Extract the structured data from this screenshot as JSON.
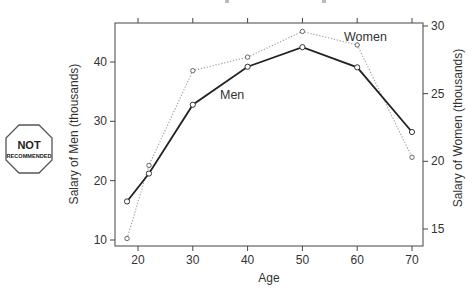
{
  "badge": {
    "line1": "NOT",
    "line2": "RECOMMENDED"
  },
  "chart_data": {
    "type": "line",
    "title": "",
    "xlabel": "Age",
    "ylabel": "Salary of Men (thousands)",
    "y2label": "Salary of Women (thousands)",
    "x": [
      18,
      22,
      30,
      40,
      50,
      60,
      70
    ],
    "x_ticks": [
      "20",
      "30",
      "40",
      "50",
      "60",
      "70"
    ],
    "x_tick_values": [
      20,
      30,
      40,
      50,
      60,
      70
    ],
    "y_ticks": [
      "10",
      "20",
      "30",
      "40"
    ],
    "y_tick_values": [
      10,
      20,
      30,
      40
    ],
    "y2_ticks": [
      "15",
      "20",
      "25",
      "30"
    ],
    "y2_tick_values": [
      15,
      20,
      25,
      30
    ],
    "xlim": [
      16,
      72
    ],
    "ylim": [
      8.9,
      46.5
    ],
    "y2lim": [
      14.2,
      30.3
    ],
    "grid": false,
    "legend": "none (direct line labels)",
    "series": [
      {
        "name": "Men",
        "axis": "left",
        "style": "solid",
        "color": "#222222",
        "values": [
          16.5,
          21.2,
          32.8,
          39.2,
          42.5,
          39.1,
          28.2
        ]
      },
      {
        "name": "Women",
        "axis": "right",
        "style": "dotted",
        "color": "#999999",
        "values": [
          14.3,
          19.7,
          26.7,
          27.7,
          29.6,
          28.6,
          20.3
        ]
      }
    ],
    "annotations": [
      {
        "text": "Men",
        "near_age": 37
      },
      {
        "text": "Women",
        "near_age": 55
      }
    ]
  }
}
